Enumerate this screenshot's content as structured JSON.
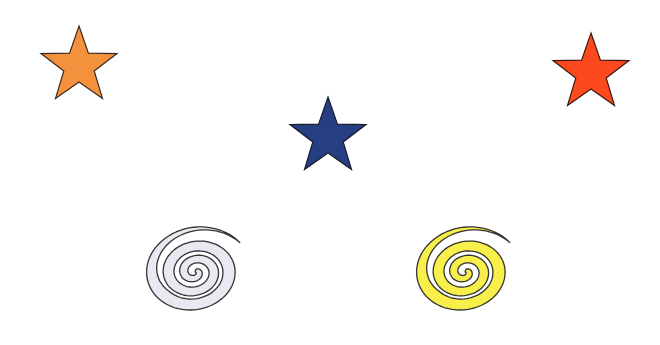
{
  "canvas": {
    "width": 660,
    "height": 345,
    "background": "#ffffff"
  },
  "shapes": [
    {
      "type": "star",
      "name": "orange-star",
      "color": "#F4913C",
      "stroke": "#3a2a20",
      "cx": 79,
      "cy": 66,
      "r_outer": 40,
      "r_inner": 16
    },
    {
      "type": "star",
      "name": "blue-star",
      "color": "#263F82",
      "stroke": "#1a1a2a",
      "cx": 328,
      "cy": 137,
      "r_outer": 40,
      "r_inner": 16
    },
    {
      "type": "star",
      "name": "red-star",
      "color": "#FC4A1E",
      "stroke": "#3a1a10",
      "cx": 591,
      "cy": 73,
      "r_outer": 40,
      "r_inner": 16
    },
    {
      "type": "spiral",
      "name": "lavender-spiral",
      "color": "#ECE8F2",
      "stroke": "#333333",
      "cx": 195,
      "cy": 272
    },
    {
      "type": "spiral",
      "name": "yellow-spiral",
      "color": "#F9EF4A",
      "stroke": "#333333",
      "cx": 465,
      "cy": 272
    }
  ]
}
